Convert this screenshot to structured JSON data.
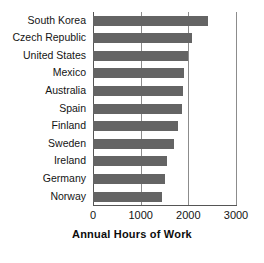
{
  "chart_data": {
    "type": "bar",
    "orientation": "horizontal",
    "title": "",
    "xlabel": "Annual Hours of Work",
    "ylabel": "",
    "xlim": [
      0,
      3000
    ],
    "xticks": [
      0,
      1000,
      2000,
      3000
    ],
    "xtick_labels": [
      "0",
      "1000",
      "2000",
      "3000"
    ],
    "grid": true,
    "grid_axis": "x",
    "legend": false,
    "bar_color": "#646464",
    "categories": [
      "South Korea",
      "Czech Republic",
      "United States",
      "Mexico",
      "Australia",
      "Spain",
      "Finland",
      "Sweden",
      "Ireland",
      "Germany",
      "Norway"
    ],
    "values": [
      2410,
      2080,
      1990,
      1900,
      1880,
      1860,
      1780,
      1700,
      1560,
      1510,
      1440
    ]
  }
}
